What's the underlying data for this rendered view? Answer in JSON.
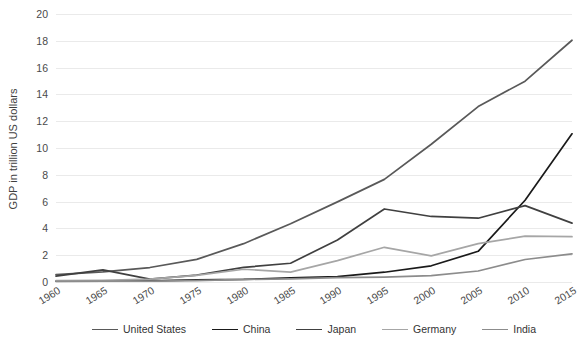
{
  "chart_data": {
    "type": "line",
    "title": "",
    "xlabel": "",
    "ylabel": "GDP in trillion US dollars",
    "x": [
      1960,
      1965,
      1970,
      1975,
      1980,
      1985,
      1990,
      1995,
      2000,
      2005,
      2010,
      2015
    ],
    "xtick_labels": [
      "1960",
      "1965",
      "1970",
      "1975",
      "1980",
      "1985",
      "1990",
      "1995",
      "2000",
      "2005",
      "2010",
      "2015"
    ],
    "ytick_labels": [
      "0",
      "2",
      "4",
      "6",
      "8",
      "10",
      "12",
      "14",
      "16",
      "18",
      "20"
    ],
    "yticks": [
      0,
      2,
      4,
      6,
      8,
      10,
      12,
      14,
      16,
      18,
      20
    ],
    "ylim": [
      0,
      20
    ],
    "grid": "horizontal",
    "legend_position": "bottom",
    "series": [
      {
        "name": "United States",
        "color": "#595959",
        "width": 1.7,
        "values": [
          0.55,
          0.75,
          1.08,
          1.69,
          2.86,
          4.35,
          5.98,
          7.66,
          10.28,
          13.09,
          14.99,
          18.04
        ]
      },
      {
        "name": "China",
        "color": "#1a1a1a",
        "width": 1.7,
        "values": [
          0.06,
          0.07,
          0.09,
          0.16,
          0.19,
          0.31,
          0.4,
          0.73,
          1.21,
          2.29,
          6.1,
          11.06
        ]
      },
      {
        "name": "Japan",
        "color": "#404040",
        "width": 1.7,
        "values": [
          0.44,
          0.91,
          0.21,
          0.52,
          1.09,
          1.4,
          3.14,
          5.45,
          4.89,
          4.76,
          5.7,
          4.39
        ]
      },
      {
        "name": "Germany",
        "color": "#a6a6a6",
        "width": 1.7,
        "values": [
          0.1,
          0.12,
          0.21,
          0.5,
          0.95,
          0.74,
          1.6,
          2.59,
          1.95,
          2.86,
          3.42,
          3.38
        ]
      },
      {
        "name": "India",
        "color": "#8c8c8c",
        "width": 1.7,
        "values": [
          0.04,
          0.06,
          0.06,
          0.1,
          0.19,
          0.24,
          0.32,
          0.36,
          0.47,
          0.82,
          1.68,
          2.1
        ]
      }
    ]
  },
  "legend": {
    "items": [
      {
        "label": "United States"
      },
      {
        "label": "China"
      },
      {
        "label": "Japan"
      },
      {
        "label": "Germany"
      },
      {
        "label": "India"
      }
    ]
  }
}
